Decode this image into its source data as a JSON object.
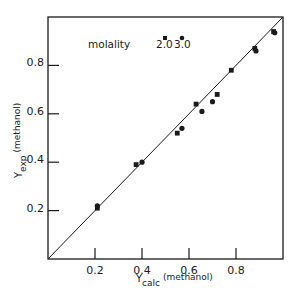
{
  "chart_data": {
    "type": "scatter",
    "title": "",
    "xlabel": "Y_calc (methanol)",
    "ylabel": "Y_exp (methanol)",
    "xlabel_parts": {
      "main": "Y",
      "sub": "calc",
      "suffix": "(methanol)"
    },
    "ylabel_parts": {
      "main": "Y",
      "sub": "exp",
      "suffix": "(methanol)"
    },
    "xlim": [
      0,
      1.0
    ],
    "ylim": [
      0,
      1.0
    ],
    "x_ticks": [
      0.2,
      0.4,
      0.6,
      0.8
    ],
    "y_ticks": [
      0.2,
      0.4,
      0.6,
      0.8
    ],
    "x_tick_labels": [
      "0.2",
      "0.4",
      "0.6",
      "0.8"
    ],
    "y_tick_labels": [
      "0.2",
      "0.4",
      "0.6",
      "0.8"
    ],
    "grid": false,
    "reference_line": {
      "type": "y=x",
      "from": [
        0,
        0
      ],
      "to": [
        1,
        1
      ]
    },
    "legend": {
      "title": "molality",
      "position": "upper-left",
      "entries": [
        {
          "label": "2.0",
          "marker": "square"
        },
        {
          "label": "3.0",
          "marker": "circle"
        }
      ]
    },
    "series": [
      {
        "name": "2.0",
        "marker": "square",
        "points": [
          [
            0.21,
            0.21
          ],
          [
            0.375,
            0.39
          ],
          [
            0.55,
            0.52
          ],
          [
            0.63,
            0.64
          ],
          [
            0.72,
            0.68
          ],
          [
            0.78,
            0.78
          ],
          [
            0.88,
            0.87
          ],
          [
            0.96,
            0.94
          ]
        ]
      },
      {
        "name": "3.0",
        "marker": "circle",
        "points": [
          [
            0.21,
            0.22
          ],
          [
            0.4,
            0.4
          ],
          [
            0.57,
            0.54
          ],
          [
            0.655,
            0.61
          ],
          [
            0.7,
            0.65
          ],
          [
            0.885,
            0.86
          ],
          [
            0.965,
            0.935
          ]
        ]
      }
    ]
  },
  "colors": {
    "ink": "#1a1a1a",
    "background": "#ffffff"
  }
}
